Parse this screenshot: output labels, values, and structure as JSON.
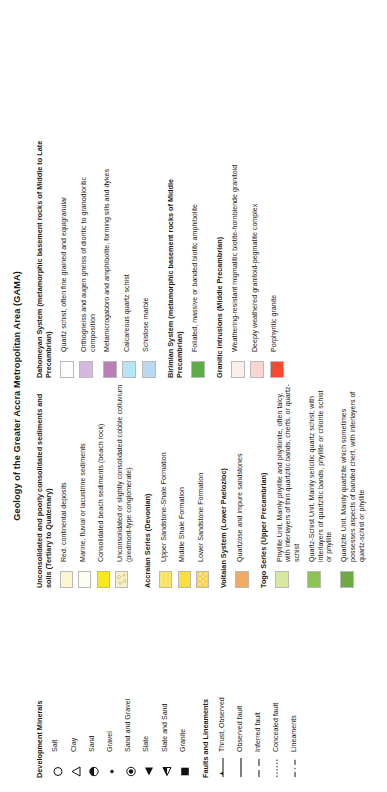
{
  "title": "Geology of the Greater Accra Metropolitan Area (GAMA)",
  "groups": {
    "development_minerals": {
      "heading": "Development Minerals",
      "items": [
        {
          "label": "Salt",
          "symbol": "open-circle-symbol"
        },
        {
          "label": "Clay",
          "symbol": "open-triangle-symbol"
        },
        {
          "label": "Sand",
          "symbol": "half-filled-circle-symbol"
        },
        {
          "label": "Gravel",
          "symbol": "small-dot-symbol"
        },
        {
          "label": "Sand and Gravel",
          "symbol": "bullseye-circle-symbol"
        },
        {
          "label": "Slate",
          "symbol": "filled-triangle-symbol"
        },
        {
          "label": "Slate and Sand",
          "symbol": "half-filled-triangle-symbol"
        },
        {
          "label": "Granite",
          "symbol": "filled-square-symbol"
        }
      ]
    },
    "faults": {
      "heading": "Faults and Lineaments",
      "items": [
        {
          "label": "Thrust, Observed",
          "symbol": "thrust-line-symbol"
        },
        {
          "label": "Observed fault",
          "symbol": "solid-line-symbol"
        },
        {
          "label": "Inferred fault",
          "symbol": "dashed-line-symbol"
        },
        {
          "label": "Concealed fault",
          "symbol": "dotted-line-symbol"
        },
        {
          "label": "Lineaments",
          "symbol": "dash-dot-line-symbol"
        }
      ]
    },
    "quaternary": {
      "heading": "Unconsolidated and poorly consolidated sediments and soils (Tertiary to Quaternary)",
      "items": [
        {
          "label": "Red, continental deposits",
          "color": "#fbf6cf"
        },
        {
          "label": "Marine, fluvial or lacustrine sediments",
          "color": "#fefdf2"
        },
        {
          "label": "Consolidated beach sediments (beach rock)",
          "color": "#fbe71f"
        },
        {
          "label": "Unconsolidated or slightly consolidated cobble colluvium (piedmont-type conglomerate)",
          "color": "#f7f0c8"
        }
      ]
    },
    "accraian": {
      "heading": "Accraian Series (Devonian)",
      "items": [
        {
          "label": "Upper Sandstone-Shale Formation",
          "color": "#fae96a"
        },
        {
          "label": "Middle Shale Formation",
          "color": "#fbdf3a"
        },
        {
          "label": "Lower Sandstone Formation",
          "color": "#f9d44a"
        }
      ]
    },
    "voltaian": {
      "heading": "Voltaian System (Lower Paelozioc)",
      "items": [
        {
          "label": "Quartzose and impure sandstones",
          "color": "#f2ab62"
        }
      ]
    },
    "togo": {
      "heading": "Togo Series (Upper Precambrian)",
      "items": [
        {
          "label": "Phyllite Unit. Mainly phyllite and phyllonite, often talcy, with interlayers of thin quartzitic bands, cherts, or quartz-schist",
          "color": "#d6e7a0"
        },
        {
          "label": "Quartz-Schist Unit. Mainly sericitic quartz schist; with interlayers of quartzitic bands, phyllite or chlorite schist or phyllite",
          "color": "#8dc254"
        },
        {
          "label": "Quartzite Unit. Mainly quartzite which sometimes possesses aspects of banded chert, with interlayers of quartz-schist or phyllite",
          "color": "#6fa944"
        }
      ]
    },
    "dahomeyan": {
      "heading": "Dahomeyan System (metamorphic basement rocks of Middle to Late Precambrian)",
      "items": [
        {
          "label": "Quartz schist, often fine grained and equigranular",
          "color": "#fdfdfd"
        },
        {
          "label": "Orthogneiss and augen gneiss of dioritic to granodioritic composition",
          "color": "#d5b8de"
        },
        {
          "label": "Metamicrogabbro and amphibolite, forming sills and dykes",
          "color": "#b97fb5"
        },
        {
          "label": "Calcareous quartz schist",
          "color": "#b5e6f5"
        },
        {
          "label": "Schistose marble",
          "color": "#bcd9f2"
        }
      ]
    },
    "birimian": {
      "heading": "Birimian System (metamorphic basement rocks of Middle Precambrian)",
      "items": [
        {
          "label": "Foliated, massive or banded biotitc amphibolite",
          "color": "#5aae45"
        }
      ]
    },
    "granitic": {
      "heading": "Granitic intrusions (Middle Precambrian)",
      "items": [
        {
          "label": "Weathering-resistant migmatitic biotite-hornblende granitoid",
          "color": "#fbefee"
        },
        {
          "label": "Deeply weathered granitoid-pegmatite complex",
          "color": "#fbd5cf"
        },
        {
          "label": "Porphyritic granite",
          "color": "#f8492f"
        }
      ]
    }
  }
}
